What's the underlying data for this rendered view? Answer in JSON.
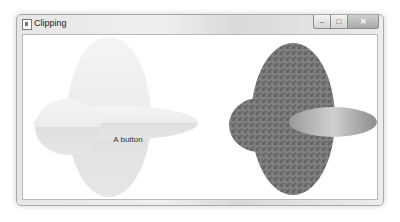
{
  "window": {
    "title": "Clipping",
    "icon": "app-window-icon",
    "controls": {
      "minimize": "–",
      "maximize": "□",
      "close": "✕"
    }
  },
  "left_panel": {
    "button_label": "A button",
    "shape": "clipped-ellipses",
    "fill_top": "#f1f1f1",
    "fill_bottom": "#e4e4e4"
  },
  "right_panel": {
    "content": "clipped-grass-image",
    "shape": "clipped-ellipses"
  }
}
